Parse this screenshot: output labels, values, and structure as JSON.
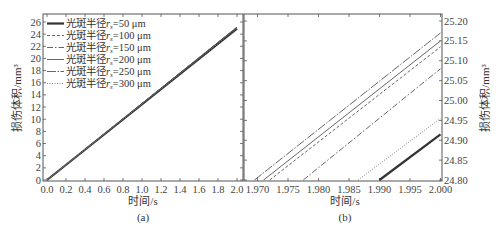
{
  "chart_data": [
    {
      "panel": "(a)",
      "type": "line",
      "xlabel": "时间/s",
      "ylabel": "损伤体积/mm³",
      "xlim": [
        0.0,
        2.0
      ],
      "ylim": [
        0,
        26
      ],
      "xticks": [
        "0.0",
        "0.2",
        "0.4",
        "0.6",
        "0.8",
        "1.0",
        "1.2",
        "1.4",
        "1.6",
        "1.8",
        "2.0"
      ],
      "yticks": [
        "0",
        "2",
        "4",
        "6",
        "8",
        "10",
        "12",
        "14",
        "16",
        "18",
        "20",
        "22",
        "24",
        "26"
      ],
      "legend_position": "upper left",
      "grid": false,
      "series": [
        {
          "name": "光斑半径r_s=50 μm",
          "style": "thick-solid",
          "x": [
            0.0,
            2.0
          ],
          "y": [
            0.0,
            24.915
          ]
        },
        {
          "name": "光斑半径r_s=100 μm",
          "style": "dashed",
          "x": [
            0.0,
            2.0
          ],
          "y": [
            0.0,
            25.135
          ]
        },
        {
          "name": "光斑半径r_s=150 μm",
          "style": "dash-dot",
          "x": [
            0.0,
            2.0
          ],
          "y": [
            0.0,
            25.08
          ]
        },
        {
          "name": "光斑半径r_s=200 μm",
          "style": "solid",
          "x": [
            0.0,
            2.0
          ],
          "y": [
            0.0,
            25.15
          ]
        },
        {
          "name": "光斑半径r_s=250 μm",
          "style": "long-dash-dot",
          "x": [
            0.0,
            2.0
          ],
          "y": [
            0.0,
            25.17
          ]
        },
        {
          "name": "光斑半径r_s=300 μm",
          "style": "dotted",
          "x": [
            0.0,
            2.0
          ],
          "y": [
            0.0,
            24.955
          ]
        }
      ]
    },
    {
      "panel": "(b)",
      "type": "line",
      "xlabel": "时间/s",
      "ylabel": "损伤体积/mm³",
      "xlim": [
        1.967,
        2.0
      ],
      "ylim": [
        24.8,
        25.2
      ],
      "xticks": [
        "1.970",
        "1.975",
        "1.980",
        "1.985",
        "1.990",
        "1.995",
        "2.000"
      ],
      "yticks": [
        "24.80",
        "24.85",
        "24.90",
        "24.95",
        "25.00",
        "25.05",
        "25.10",
        "25.15",
        "25.20"
      ],
      "yaxis_side": "right",
      "grid": false,
      "series": [
        {
          "name": "光斑半径r_s=50 μm",
          "style": "thick-solid",
          "x": [
            1.99,
            2.0
          ],
          "y": [
            24.8,
            24.915
          ]
        },
        {
          "name": "光斑半径r_s=100 μm",
          "style": "dashed",
          "x": [
            1.972,
            2.0
          ],
          "y": [
            24.8,
            25.135
          ]
        },
        {
          "name": "光斑半径r_s=150 μm",
          "style": "dash-dot",
          "x": [
            1.9775,
            2.0
          ],
          "y": [
            24.8,
            25.08
          ]
        },
        {
          "name": "光斑半径r_s=200 μm",
          "style": "solid",
          "x": [
            1.971,
            2.0
          ],
          "y": [
            24.8,
            25.15
          ]
        },
        {
          "name": "光斑半径r_s=250 μm",
          "style": "long-dash-dot",
          "x": [
            1.9695,
            2.0
          ],
          "y": [
            24.8,
            25.17
          ]
        },
        {
          "name": "光斑半径r_s=300 μm",
          "style": "dotted",
          "x": [
            1.9865,
            2.0
          ],
          "y": [
            24.8,
            24.955
          ]
        }
      ]
    }
  ],
  "captions": {
    "a": "(a)",
    "b": "(b)"
  },
  "legend": {
    "items": [
      {
        "prefix": "光斑半径",
        "var": "r",
        "sub": "s",
        "value": "=50 μm"
      },
      {
        "prefix": "光斑半径",
        "var": "r",
        "sub": "s",
        "value": "=100 μm"
      },
      {
        "prefix": "光斑半径",
        "var": "r",
        "sub": "s",
        "value": "=150 μm"
      },
      {
        "prefix": "光斑半径",
        "var": "r",
        "sub": "s",
        "value": "=200 μm"
      },
      {
        "prefix": "光斑半径",
        "var": "r",
        "sub": "s",
        "value": "=250 μm"
      },
      {
        "prefix": "光斑半径",
        "var": "r",
        "sub": "s",
        "value": "=300 μm"
      }
    ]
  },
  "colors": {
    "axis": "#555555",
    "line": "#555555",
    "thick_line": "#333333"
  }
}
